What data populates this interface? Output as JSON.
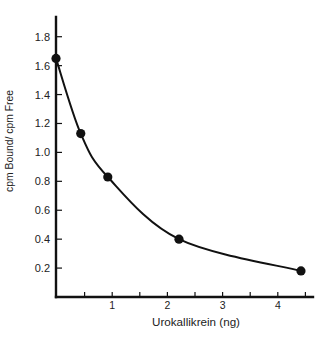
{
  "chart_data": {
    "type": "line",
    "title": "",
    "xlabel": "Urokallikrein (ng)",
    "ylabel": "cpm Bound/ cpm Free",
    "series": [
      {
        "name": "",
        "x": [
          0,
          0.43,
          0.92,
          2.21,
          4.42
        ],
        "y": [
          1.65,
          1.13,
          0.83,
          0.4,
          0.18
        ],
        "style": "smooth curve with filled circle markers"
      }
    ],
    "xlim": [
      0,
      4.6
    ],
    "ylim": [
      0,
      1.9
    ],
    "x_ticks": [
      {
        "value": 1,
        "label": "1"
      },
      {
        "value": 2,
        "label": "2"
      },
      {
        "value": 3,
        "label": "3"
      },
      {
        "value": 4,
        "label": "4"
      }
    ],
    "x_minor_ticks": [
      0.5,
      1.5,
      2.5,
      3.5,
      4.5
    ],
    "y_ticks": [
      {
        "value": 0.2,
        "label": "0.2"
      },
      {
        "value": 0.4,
        "label": "0.4"
      },
      {
        "value": 0.6,
        "label": "0.6"
      },
      {
        "value": 0.8,
        "label": "0.8"
      },
      {
        "value": 1.0,
        "label": "1.0"
      },
      {
        "value": 1.2,
        "label": "1.2"
      },
      {
        "value": 1.4,
        "label": "1.4"
      },
      {
        "value": 1.6,
        "label": "1.6"
      },
      {
        "value": 1.8,
        "label": "1.8"
      }
    ],
    "grid": false,
    "legend": null,
    "colors": {
      "ink": "#111111",
      "text": "#222222",
      "background": "#ffffff"
    }
  }
}
